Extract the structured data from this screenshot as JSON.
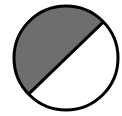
{
  "diagram": {
    "shaded_fraction": 0.5,
    "colors": {
      "shaded": "#6e6e6e",
      "unshaded": "#ffffff",
      "outline": "#000000"
    }
  }
}
